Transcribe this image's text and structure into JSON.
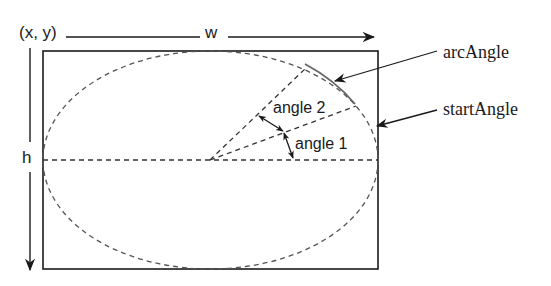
{
  "diagram": {
    "type": "arc-geometry",
    "labels": {
      "origin": "(x, y)",
      "width": "w",
      "height": "h",
      "angle1": "angle 1",
      "angle2": "angle 2",
      "arc_angle": "arcAngle",
      "start_angle": "startAngle"
    },
    "colors": {
      "stroke": "#1a1a1a",
      "dashed": "#555555",
      "arc": "#666666",
      "background": "#ffffff"
    },
    "geometry": {
      "rect": {
        "x": 43,
        "y": 51,
        "w": 335,
        "h": 218
      },
      "center": {
        "x": 210,
        "y": 160
      }
    }
  }
}
